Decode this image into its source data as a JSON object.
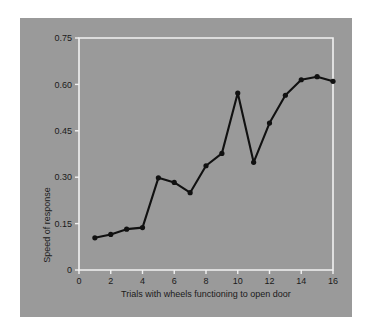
{
  "figure": {
    "background_color": "#ffffff",
    "panel_color": "#9a9a9a",
    "frame_color": "#f2f2f2",
    "series_color": "#111111",
    "text_color": "#1b1b1b"
  },
  "chart_data": {
    "type": "line",
    "title": "",
    "xlabel": "Trials with wheels functioning to open door",
    "ylabel": "Speed of response",
    "x": [
      1,
      2,
      3,
      4,
      5,
      6,
      7,
      8,
      9,
      10,
      11,
      12,
      13,
      14,
      15,
      16
    ],
    "values": [
      0.104,
      0.115,
      0.132,
      0.137,
      0.298,
      0.283,
      0.25,
      0.337,
      0.377,
      0.572,
      0.348,
      0.475,
      0.565,
      0.615,
      0.625,
      0.61
    ],
    "series": [
      {
        "name": "Speed of response",
        "values": [
          0.104,
          0.115,
          0.132,
          0.137,
          0.298,
          0.283,
          0.25,
          0.337,
          0.377,
          0.572,
          0.348,
          0.475,
          0.565,
          0.615,
          0.625,
          0.61
        ]
      }
    ],
    "xlim": [
      0,
      16
    ],
    "ylim": [
      0,
      0.75
    ],
    "xticks": [
      0,
      2,
      4,
      6,
      8,
      10,
      12,
      14,
      16
    ],
    "xticklabels": [
      "0",
      "2",
      "4",
      "6",
      "8",
      "10",
      "12",
      "14",
      "16"
    ],
    "yticks": [
      0,
      0.15,
      0.3,
      0.45,
      0.6,
      0.75
    ],
    "yticklabels": [
      "0",
      "0.15",
      "0.30",
      "0.45",
      "0.60",
      "0.75"
    ],
    "grid": false,
    "legend": false,
    "legend_position": "none",
    "markers": true,
    "marker_shape": "circle"
  }
}
